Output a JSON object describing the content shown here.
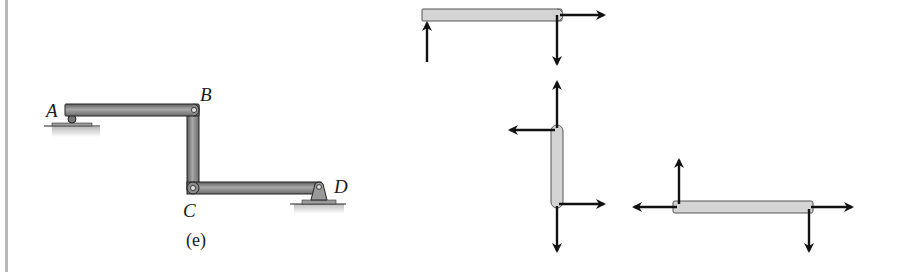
{
  "figure": {
    "caption": "(e)",
    "mechanism": {
      "points": {
        "A": "A",
        "B": "B",
        "C": "C",
        "D": "D"
      },
      "members": [
        "AB",
        "BC",
        "CD"
      ],
      "supports": [
        {
          "point": "A",
          "type": "roller"
        },
        {
          "point": "D",
          "type": "pin"
        }
      ]
    },
    "free_body_diagrams": [
      {
        "member": "AB",
        "forces": [
          {
            "at": "A",
            "direction": "up"
          },
          {
            "at": "B",
            "direction": "right"
          },
          {
            "at": "B",
            "direction": "down"
          }
        ]
      },
      {
        "member": "BC",
        "forces": [
          {
            "at": "B",
            "direction": "up"
          },
          {
            "at": "B",
            "direction": "left"
          },
          {
            "at": "C",
            "direction": "right"
          },
          {
            "at": "C",
            "direction": "down"
          }
        ]
      },
      {
        "member": "CD",
        "forces": [
          {
            "at": "C",
            "direction": "up"
          },
          {
            "at": "C",
            "direction": "left"
          },
          {
            "at": "D",
            "direction": "right"
          },
          {
            "at": "D",
            "direction": "down"
          }
        ]
      }
    ]
  },
  "colors": {
    "bar_dark": "#6e6e6e",
    "bar_light": "#a9a9a9",
    "fbd_fill": "#d4d4d4",
    "arrow": "#111111",
    "rule": "#b8b8b8"
  }
}
